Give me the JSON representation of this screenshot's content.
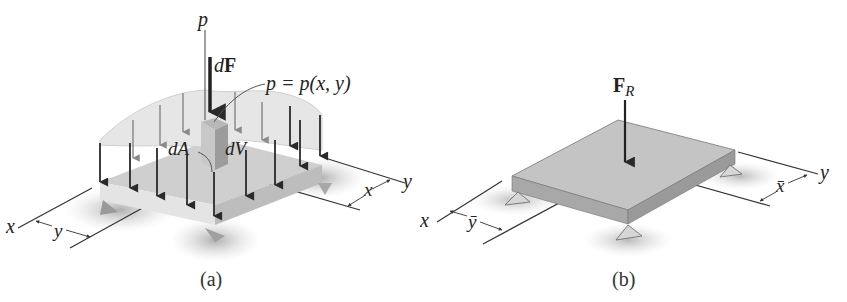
{
  "figure": {
    "panel_a": {
      "caption": "(a)",
      "labels": {
        "pressure_axis": "p",
        "force_element": "dF",
        "force_element_d": "d",
        "force_element_F": "F",
        "pressure_function": "p = p(x, y)",
        "area_element": "dA",
        "volume_element": "dV",
        "x_axis": "x",
        "y_axis": "y",
        "dim_x": "x",
        "dim_y": "y"
      }
    },
    "panel_b": {
      "caption": "(b)",
      "labels": {
        "resultant_force": "F",
        "resultant_force_sub": "R",
        "x_axis": "x",
        "y_axis": "y",
        "dim_xbar": "x̄",
        "dim_ybar": "ȳ"
      }
    },
    "colors": {
      "line": "#333333",
      "arrow_dark": "#2a2a2a",
      "arrow_light": "#8a8a8a",
      "plate_top": "#c4c4c4",
      "plate_side": "#a8a8a8",
      "pressure_surface": "#e2e2e2",
      "shadow": "#bdbdbd"
    }
  }
}
